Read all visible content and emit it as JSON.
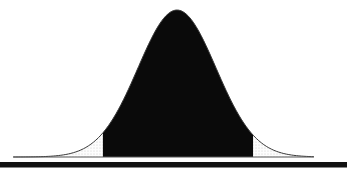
{
  "figure": {
    "colors": {
      "background": "#ffffff",
      "central_fill": "#0a0a0a",
      "curve_stroke": "#3a3a3a",
      "baseline_stroke": "#555555",
      "bottom_rule": "#111111",
      "tail_stipple_dot": "#c9c9c9",
      "tail_base": "#fdfdfd"
    }
  },
  "chart_data": {
    "type": "area",
    "title": "",
    "xlabel": "",
    "ylabel": "",
    "distribution": "normal",
    "mean": 0,
    "sd": 1,
    "x_range": [
      -4.2,
      3.51
    ],
    "grid": false,
    "legend": false,
    "axis_ticks": [],
    "shaded_region": {
      "from": -1.9,
      "to": 1.95,
      "style": "solid-black",
      "description": "central area under the normal curve filled black"
    },
    "tails": [
      {
        "side": "left",
        "from": -4.2,
        "to": -1.9,
        "style": "stipple"
      },
      {
        "side": "right",
        "from": 1.95,
        "to": 3.51,
        "style": "stipple"
      }
    ]
  }
}
